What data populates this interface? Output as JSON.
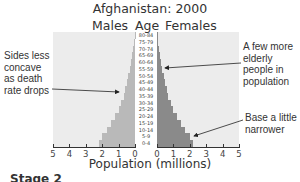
{
  "chart_data": {
    "type": "bar",
    "subtype": "population-pyramid",
    "title": "Afghanistan: 2000",
    "left_header": "Males",
    "center_header": "Age",
    "right_header": "Females",
    "xlabel": "Population (millions)",
    "ylabel": "Age",
    "xlim": [
      0,
      5
    ],
    "x_ticks_left": [
      "5",
      "4",
      "3",
      "2",
      "1",
      "0"
    ],
    "x_ticks_right": [
      "0",
      "1",
      "2",
      "3",
      "4",
      "5"
    ],
    "categories": [
      "80-84",
      "75-79",
      "70-74",
      "65-69",
      "60-64",
      "55-59",
      "50-54",
      "45-49",
      "40-44",
      "35-39",
      "30-34",
      "25-29",
      "20-24",
      "15-19",
      "10-14",
      "5-9",
      "0-4"
    ],
    "series": [
      {
        "name": "Males",
        "color": "#b9b9b9",
        "values": [
          0.03,
          0.07,
          0.12,
          0.18,
          0.25,
          0.32,
          0.4,
          0.5,
          0.6,
          0.7,
          0.85,
          1.0,
          1.2,
          1.45,
          1.7,
          2.0,
          2.2
        ]
      },
      {
        "name": "Females",
        "color": "#8a8a8a",
        "values": [
          0.03,
          0.07,
          0.12,
          0.18,
          0.25,
          0.32,
          0.4,
          0.5,
          0.6,
          0.7,
          0.85,
          1.0,
          1.2,
          1.45,
          1.7,
          2.0,
          2.2
        ]
      }
    ],
    "annotations": [
      {
        "text": "Sides less concave as death rate drops",
        "points_to": "males 35-39"
      },
      {
        "text": "A few more elderly people in population",
        "points_to": "females 60-64"
      },
      {
        "text": "Base a little narrower",
        "points_to": "females 0-4"
      }
    ],
    "grid": false,
    "legend": "none"
  },
  "footer": {
    "stage_label": "Stage 2"
  },
  "annotations": {
    "left": [
      "Sides less",
      "concave",
      "as death",
      "rate drops"
    ],
    "right_top": [
      "A few more",
      "elderly",
      "people in",
      "population"
    ],
    "right_bottom": [
      "Base a little",
      "narrower"
    ]
  }
}
